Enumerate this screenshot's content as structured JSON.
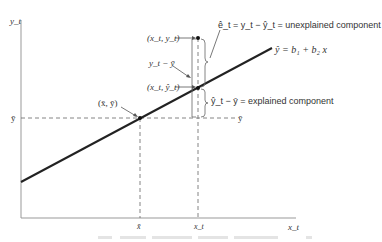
{
  "axes": {
    "y_label": "y_t",
    "x_label": "x_t"
  },
  "labels": {
    "mean_point": "(x̄, ȳ)",
    "actual_point": "(x_t, y_t)",
    "fitted_point": "(x_t, ŷ_t)",
    "total_deviation": "y_t − ȳ",
    "residual": "ê_t = y_t − ŷ_t = unexplained component",
    "explained": "ŷ_t − ȳ = explained component",
    "regression_line": "ŷ = b₁ + b₂ x",
    "ybar_left": "ȳ",
    "ybar_right": "ȳ",
    "xbar_tick": "x̄",
    "xt_tick": "x_t"
  },
  "caption": "",
  "colors": {
    "line": "#222222",
    "axis": "#888888",
    "dash": "#555555"
  }
}
